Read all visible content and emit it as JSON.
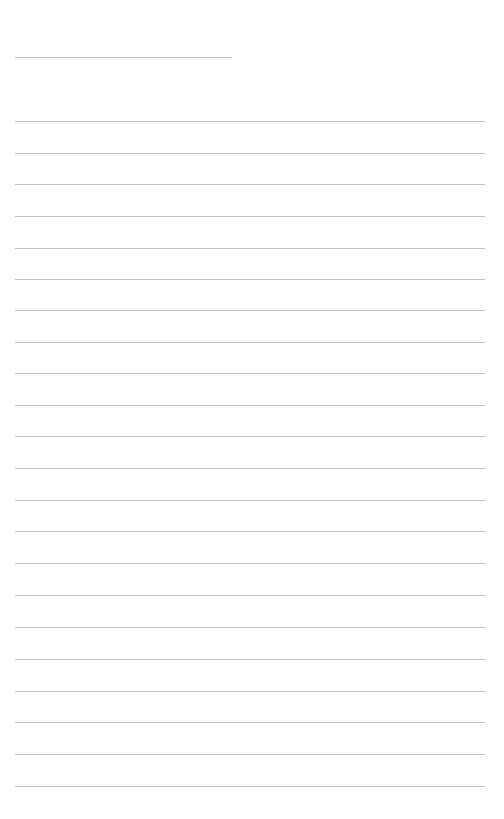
{
  "page": {
    "type": "lined-paper",
    "background": "#ffffff",
    "line_color": "#c4c4c4"
  },
  "header_line": {
    "x1": 15,
    "x2": 232,
    "y": 57
  },
  "body_lines": {
    "x1": 15,
    "x2": 485,
    "y_positions": [
      121,
      153,
      184,
      216,
      248,
      279,
      310,
      342,
      373,
      405,
      436,
      468,
      500,
      531,
      563,
      595,
      627,
      659,
      691,
      722,
      754,
      786
    ]
  }
}
